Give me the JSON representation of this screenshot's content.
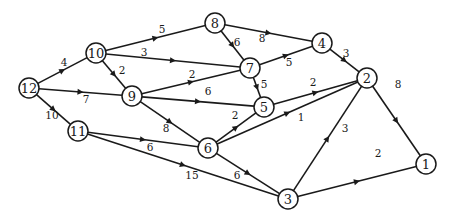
{
  "diagram": {
    "type": "directed-weighted-graph",
    "nodes": [
      {
        "id": "12",
        "label": "12",
        "x": 29,
        "y": 88
      },
      {
        "id": "10",
        "label": "10",
        "x": 96,
        "y": 53
      },
      {
        "id": "9",
        "label": "9",
        "x": 132,
        "y": 96
      },
      {
        "id": "11",
        "label": "11",
        "x": 78,
        "y": 131
      },
      {
        "id": "8",
        "label": "8",
        "x": 215,
        "y": 23
      },
      {
        "id": "7",
        "label": "7",
        "x": 250,
        "y": 68
      },
      {
        "id": "4",
        "label": "4",
        "x": 322,
        "y": 43
      },
      {
        "id": "5",
        "label": "5",
        "x": 264,
        "y": 107
      },
      {
        "id": "2",
        "label": "2",
        "x": 367,
        "y": 78
      },
      {
        "id": "6",
        "label": "6",
        "x": 208,
        "y": 148
      },
      {
        "id": "3",
        "label": "3",
        "x": 288,
        "y": 199
      },
      {
        "id": "1",
        "label": "1",
        "x": 426,
        "y": 164
      }
    ],
    "edges": [
      {
        "from": "12",
        "to": "10",
        "weight": "4",
        "lx": 64,
        "ly": 62
      },
      {
        "from": "12",
        "to": "9",
        "weight": "7",
        "lx": 86,
        "ly": 99
      },
      {
        "from": "12",
        "to": "11",
        "weight": "10",
        "lx": 52,
        "ly": 115
      },
      {
        "from": "10",
        "to": "8",
        "weight": "5",
        "lx": 162,
        "ly": 29
      },
      {
        "from": "10",
        "to": "7",
        "weight": "3",
        "lx": 144,
        "ly": 52
      },
      {
        "from": "10",
        "to": "9",
        "weight": "2",
        "lx": 122,
        "ly": 70
      },
      {
        "from": "9",
        "to": "7",
        "weight": "2",
        "lx": 192,
        "ly": 74
      },
      {
        "from": "9",
        "to": "5",
        "weight": "6",
        "lx": 208,
        "ly": 91
      },
      {
        "from": "9",
        "to": "6",
        "weight": "8",
        "lx": 166,
        "ly": 128
      },
      {
        "from": "11",
        "to": "6",
        "weight": "6",
        "lx": 150,
        "ly": 147
      },
      {
        "from": "11",
        "to": "3",
        "weight": "15",
        "lx": 192,
        "ly": 175
      },
      {
        "from": "8",
        "to": "7",
        "weight": "6",
        "lx": 237,
        "ly": 42
      },
      {
        "from": "8",
        "to": "4",
        "weight": "8",
        "lx": 262,
        "ly": 38
      },
      {
        "from": "7",
        "to": "4",
        "weight": "5",
        "lx": 289,
        "ly": 62
      },
      {
        "from": "7",
        "to": "5",
        "weight": "5",
        "lx": 264,
        "ly": 84
      },
      {
        "from": "4",
        "to": "2",
        "weight": "3",
        "lx": 346,
        "ly": 53
      },
      {
        "from": "5",
        "to": "2",
        "weight": "2",
        "lx": 313,
        "ly": 82
      },
      {
        "from": "6",
        "to": "5",
        "weight": "2",
        "lx": 235,
        "ly": 115
      },
      {
        "from": "6",
        "to": "2",
        "weight": "1",
        "lx": 301,
        "ly": 117
      },
      {
        "from": "6",
        "to": "3",
        "weight": "6",
        "lx": 237,
        "ly": 175
      },
      {
        "from": "2",
        "to": "1",
        "weight": "8",
        "lx": 398,
        "ly": 84
      },
      {
        "from": "3",
        "to": "2",
        "weight": "3",
        "lx": 345,
        "ly": 128
      },
      {
        "from": "3",
        "to": "1",
        "weight": "2",
        "lx": 378,
        "ly": 153
      }
    ]
  }
}
